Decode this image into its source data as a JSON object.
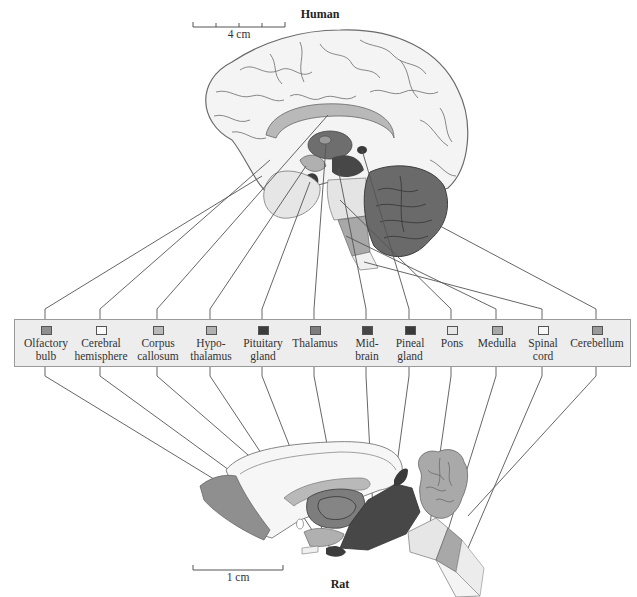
{
  "figure": {
    "human": {
      "title": "Human",
      "scale_bar": {
        "label": "4 cm",
        "ticks": 5
      }
    },
    "rat": {
      "title": "Rat",
      "scale_bar": {
        "label": "1 cm",
        "ticks": 2
      }
    },
    "legend": {
      "items": [
        {
          "id": "olfactory-bulb",
          "line1": "Olfactory",
          "line2": "bulb",
          "color": "#8f8f8f",
          "x": 45
        },
        {
          "id": "cerebral-hemisphere",
          "line1": "Cerebral",
          "line2": "hemisphere",
          "color": "#fafafa",
          "x": 100
        },
        {
          "id": "corpus-callosum",
          "line1": "Corpus",
          "line2": "callosum",
          "color": "#b9b9b9",
          "x": 157
        },
        {
          "id": "hypothalamus",
          "line1": "Hypo-",
          "line2": "thalamus",
          "color": "#b0b0b0",
          "x": 210
        },
        {
          "id": "pituitary-gland",
          "line1": "Pituitary",
          "line2": "gland",
          "color": "#3c3c3c",
          "x": 262
        },
        {
          "id": "thalamus",
          "line1": "Thalamus",
          "line2": "",
          "color": "#7d7d7d",
          "x": 314
        },
        {
          "id": "midbrain",
          "line1": "Mid-",
          "line2": "brain",
          "color": "#474747",
          "x": 366
        },
        {
          "id": "pineal-gland",
          "line1": "Pineal",
          "line2": "gland",
          "color": "#3a3a3a",
          "x": 409
        },
        {
          "id": "pons",
          "line1": "Pons",
          "line2": "",
          "color": "#e6e6e6",
          "x": 451
        },
        {
          "id": "medulla",
          "line1": "Medulla",
          "line2": "",
          "color": "#a8a8a8",
          "x": 496
        },
        {
          "id": "spinal-cord",
          "line1": "Spinal",
          "line2": "cord",
          "color": "#f7f7f7",
          "x": 542
        },
        {
          "id": "cerebellum",
          "line1": "Cerebellum",
          "line2": "",
          "color": "#9a9a9a",
          "x": 596
        }
      ]
    }
  }
}
